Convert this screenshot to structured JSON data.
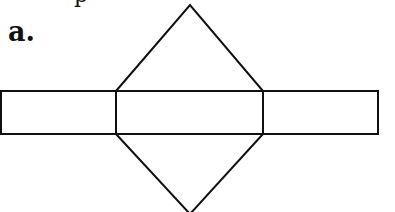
{
  "label": "a.",
  "top_cut_text": "p",
  "figure": {
    "type": "net",
    "stroke_color": "#111111",
    "fill_color": "#ffffff",
    "rectangles": [
      {
        "name": "left-rectangle",
        "x": 1,
        "y": 91,
        "width": 115,
        "height": 43
      },
      {
        "name": "middle-rectangle",
        "x": 116,
        "y": 91,
        "width": 147,
        "height": 43
      },
      {
        "name": "right-rectangle",
        "x": 263,
        "y": 91,
        "width": 115,
        "height": 43
      }
    ],
    "triangles": [
      {
        "name": "top-triangle",
        "points": "116,91 190,5 263,91"
      },
      {
        "name": "bottom-triangle",
        "points": "116,134 190,214 263,134"
      }
    ]
  }
}
